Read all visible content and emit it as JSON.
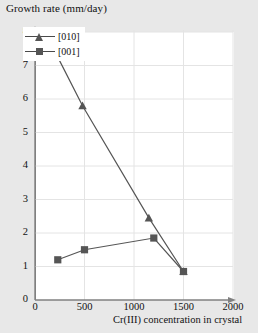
{
  "chart_data": {
    "type": "line",
    "title": "Growth rate (mm/day)",
    "xlabel": "Cr(III) concentration in crystal",
    "ylabel": "Growth rate (mm/day)",
    "xlim": [
      0,
      2000
    ],
    "ylim": [
      0,
      8
    ],
    "xticks": [
      0,
      500,
      1000,
      1500,
      2000
    ],
    "yticks": [
      0,
      1,
      2,
      3,
      4,
      5,
      6,
      7,
      8
    ],
    "xtick_labels": [
      "0",
      "500",
      "1000",
      "1500",
      "2000"
    ],
    "ytick_labels": [
      "0",
      "1",
      "2",
      "3",
      "4",
      "5",
      "6",
      "7",
      "8"
    ],
    "grid": true,
    "legend_position": "top-left",
    "series": [
      {
        "name": "[010]",
        "marker": "triangle",
        "color": "#555555",
        "points": [
          {
            "x": 230,
            "y": 7.25
          },
          {
            "x": 480,
            "y": 5.8
          },
          {
            "x": 1150,
            "y": 2.45
          },
          {
            "x": 1500,
            "y": 0.85
          }
        ]
      },
      {
        "name": "[001]",
        "marker": "square",
        "color": "#555555",
        "points": [
          {
            "x": 230,
            "y": 1.2
          },
          {
            "x": 500,
            "y": 1.5
          },
          {
            "x": 1200,
            "y": 1.85
          },
          {
            "x": 1500,
            "y": 0.85
          }
        ]
      }
    ]
  },
  "legend": {
    "items": [
      {
        "label": "[010]"
      },
      {
        "label": "[001]"
      }
    ]
  },
  "axes": {
    "y_labels": [
      "8",
      "7",
      "6",
      "5",
      "4",
      "3",
      "2",
      "1",
      "0"
    ],
    "x_labels": [
      "0",
      "500",
      "1000",
      "1500",
      "2000"
    ],
    "x_origin_label": "0"
  },
  "colors": {
    "series": "#555555",
    "axis": "#808080",
    "grid": "#e4e4e4",
    "page_background": "#e8e8e8",
    "plot_background": "#ffffff"
  }
}
